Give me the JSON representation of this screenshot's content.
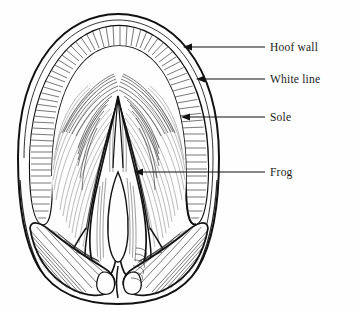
{
  "figure": {
    "background_color": "#fefefe",
    "ink_color": "#111111",
    "width": 359,
    "height": 311,
    "style": "black-and-white pen-and-ink line drawing with hatching"
  },
  "labels": [
    {
      "id": "hoof-wall",
      "text": "Hoof wall",
      "text_x": 270,
      "text_y": 51,
      "leader_from_x": 265,
      "leader_to_x": 183,
      "leader_y": 47,
      "arrow_direction": "left"
    },
    {
      "id": "white-line",
      "text": "White line",
      "text_x": 270,
      "text_y": 83,
      "leader_from_x": 265,
      "leader_to_x": 196,
      "leader_y": 79,
      "arrow_direction": "left"
    },
    {
      "id": "sole",
      "text": "Sole",
      "text_x": 270,
      "text_y": 121,
      "leader_from_x": 265,
      "leader_to_x": 181,
      "leader_y": 117,
      "arrow_direction": "left"
    },
    {
      "id": "frog",
      "text": "Frog",
      "text_x": 270,
      "text_y": 176,
      "leader_from_x": 265,
      "leader_to_x": 134,
      "leader_y": 172,
      "arrow_direction": "left"
    }
  ]
}
